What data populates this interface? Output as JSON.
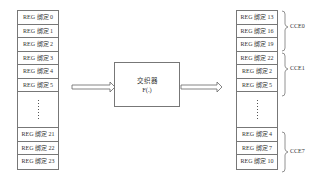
{
  "left_column": {
    "cells_top": [
      "REG 绑定 0",
      "REG 绑定 1",
      "REG 绑定 2",
      "REG 绑定 3",
      "REG 绑定 4",
      "REG 绑定 5"
    ],
    "cells_bottom": [
      "REG 绑定 21",
      "REG 绑定 22",
      "REG 绑定 23"
    ]
  },
  "transformer": {
    "title": "交织器",
    "function": "F(.)"
  },
  "right_column": {
    "cells_top": [
      "REG 绑定 13",
      "REG 绑定 16",
      "REG 绑定 19",
      "REG 绑定 22",
      "REG 绑定 2",
      "REG 绑定 5"
    ],
    "cells_bottom": [
      "REG 绑定 4",
      "REG 绑定 7",
      "REG 绑定 10"
    ]
  },
  "groups": [
    {
      "label": "CCE0"
    },
    {
      "label": "CCE1"
    },
    {
      "label": "CCE7"
    }
  ]
}
